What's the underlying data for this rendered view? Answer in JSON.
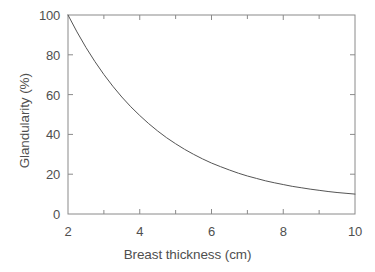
{
  "chart_data": {
    "type": "line",
    "title": "",
    "xlabel": "Breast thickness (cm)",
    "ylabel": "Glandularity (%)",
    "xlim": [
      2,
      10
    ],
    "ylim": [
      0,
      100
    ],
    "grid": false,
    "legend": null,
    "x_major_ticks": [
      2,
      4,
      6,
      8,
      10
    ],
    "x_minor_ticks": [
      3,
      5,
      7,
      9
    ],
    "y_major_ticks": [
      0,
      20,
      40,
      60,
      80,
      100
    ],
    "x_tick_labels": [
      "2",
      "4",
      "6",
      "8",
      "10"
    ],
    "y_tick_labels": [
      "0",
      "20",
      "40",
      "60",
      "80",
      "100"
    ],
    "series": [
      {
        "name": "Glandularity vs breast thickness",
        "color": "#555555",
        "x": [
          2.0,
          2.25,
          2.5,
          2.75,
          3.0,
          3.25,
          3.5,
          3.75,
          4.0,
          4.25,
          4.5,
          4.75,
          5.0,
          5.25,
          5.5,
          5.75,
          6.0,
          6.25,
          6.5,
          6.75,
          7.0,
          7.25,
          7.5,
          7.75,
          8.0,
          8.25,
          8.5,
          8.75,
          9.0,
          9.25,
          9.5,
          9.75,
          10.0
        ],
        "values": [
          100.0,
          91.5,
          83.7,
          76.6,
          70.1,
          64.2,
          58.8,
          53.9,
          49.5,
          45.4,
          41.7,
          38.3,
          35.3,
          32.5,
          30.0,
          27.7,
          25.6,
          23.8,
          22.1,
          20.5,
          19.1,
          17.9,
          16.7,
          15.7,
          14.8,
          13.9,
          13.2,
          12.5,
          11.9,
          11.3,
          10.8,
          10.4,
          10.0
        ]
      }
    ]
  },
  "axes": {
    "x_title": "Breast thickness (cm)",
    "y_title": "Glandularity (%)"
  },
  "colors": {
    "curve": "#555555",
    "frame": "#8a8a8a",
    "text": "#4f4f4f",
    "background": "#ffffff"
  }
}
